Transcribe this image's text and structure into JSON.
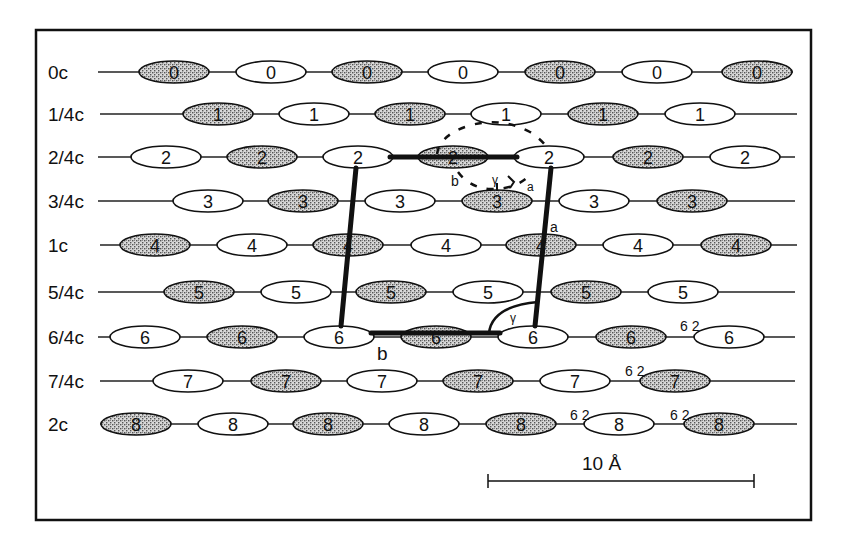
{
  "figure": {
    "frame": {
      "x": 36,
      "y": 30,
      "width": 775,
      "height": 490
    },
    "row_labels": [
      "0c",
      "1/4c",
      "2/4c",
      "3/4c",
      "1c",
      "5/4c",
      "6/4c",
      "7/4c",
      "2c"
    ],
    "rows": [
      {
        "label": "0c",
        "y": 72,
        "line": [
          98,
          793
        ],
        "molecules": [
          {
            "x": 174,
            "type": "shaded",
            "n": "0"
          },
          {
            "x": 271,
            "type": "open",
            "n": "0"
          },
          {
            "x": 367,
            "type": "shaded",
            "n": "0"
          },
          {
            "x": 463,
            "type": "open",
            "n": "0"
          },
          {
            "x": 560,
            "type": "shaded",
            "n": "0"
          },
          {
            "x": 657,
            "type": "open",
            "n": "0"
          },
          {
            "x": 757,
            "type": "shaded",
            "n": "0"
          }
        ]
      },
      {
        "label": "1/4c",
        "y": 114,
        "line": [
          100,
          797
        ],
        "molecules": [
          {
            "x": 218,
            "type": "shaded",
            "n": "1"
          },
          {
            "x": 314,
            "type": "open",
            "n": "1"
          },
          {
            "x": 410,
            "type": "shaded",
            "n": "1"
          },
          {
            "x": 506,
            "type": "open",
            "n": "1"
          },
          {
            "x": 603,
            "type": "shaded",
            "n": "1"
          },
          {
            "x": 700,
            "type": "open",
            "n": "1"
          }
        ]
      },
      {
        "label": "2/4c",
        "y": 157,
        "line": [
          98,
          795
        ],
        "molecules": [
          {
            "x": 166,
            "type": "open",
            "n": "2"
          },
          {
            "x": 262,
            "type": "shaded",
            "n": "2"
          },
          {
            "x": 358,
            "type": "open",
            "n": "2"
          },
          {
            "x": 453,
            "type": "shaded",
            "n": "2"
          },
          {
            "x": 549,
            "type": "open",
            "n": "2"
          },
          {
            "x": 648,
            "type": "shaded",
            "n": "2"
          },
          {
            "x": 745,
            "type": "open",
            "n": "2"
          }
        ]
      },
      {
        "label": "3/4c",
        "y": 201,
        "line": [
          98,
          795
        ],
        "molecules": [
          {
            "x": 208,
            "type": "open",
            "n": "3"
          },
          {
            "x": 303,
            "type": "shaded",
            "n": "3"
          },
          {
            "x": 400,
            "type": "open",
            "n": "3"
          },
          {
            "x": 497,
            "type": "shaded",
            "n": "3"
          },
          {
            "x": 594,
            "type": "open",
            "n": "3"
          },
          {
            "x": 692,
            "type": "shaded",
            "n": "3"
          }
        ]
      },
      {
        "label": "1c",
        "y": 245,
        "line": [
          100,
          797
        ],
        "molecules": [
          {
            "x": 155,
            "type": "shaded",
            "n": "4"
          },
          {
            "x": 252,
            "type": "open",
            "n": "4"
          },
          {
            "x": 348,
            "type": "shaded",
            "n": "4"
          },
          {
            "x": 446,
            "type": "open",
            "n": "4"
          },
          {
            "x": 541,
            "type": "shaded",
            "n": "4"
          },
          {
            "x": 638,
            "type": "open",
            "n": "4"
          },
          {
            "x": 736,
            "type": "shaded",
            "n": "4"
          }
        ]
      },
      {
        "label": "5/4c",
        "y": 292,
        "line": [
          98,
          795
        ],
        "molecules": [
          {
            "x": 199,
            "type": "shaded",
            "n": "5"
          },
          {
            "x": 296,
            "type": "open",
            "n": "5"
          },
          {
            "x": 391,
            "type": "shaded",
            "n": "5"
          },
          {
            "x": 488,
            "type": "open",
            "n": "5"
          },
          {
            "x": 586,
            "type": "shaded",
            "n": "5"
          },
          {
            "x": 683,
            "type": "open",
            "n": "5"
          }
        ]
      },
      {
        "label": "6/4c",
        "y": 337,
        "line": [
          98,
          795
        ],
        "molecules": [
          {
            "x": 145,
            "type": "open",
            "n": "6"
          },
          {
            "x": 242,
            "type": "shaded",
            "n": "6"
          },
          {
            "x": 339,
            "type": "open",
            "n": "6"
          },
          {
            "x": 436,
            "type": "shaded",
            "n": "6"
          },
          {
            "x": 533,
            "type": "open",
            "n": "6"
          },
          {
            "x": 631,
            "type": "shaded",
            "n": "6"
          },
          {
            "x": 729,
            "type": "open",
            "n": "6"
          }
        ]
      },
      {
        "label": "7/4c",
        "y": 381,
        "line": [
          100,
          795
        ],
        "molecules": [
          {
            "x": 188,
            "type": "open",
            "n": "7"
          },
          {
            "x": 286,
            "type": "shaded",
            "n": "7"
          },
          {
            "x": 382,
            "type": "open",
            "n": "7"
          },
          {
            "x": 478,
            "type": "shaded",
            "n": "7"
          },
          {
            "x": 575,
            "type": "open",
            "n": "7"
          },
          {
            "x": 675,
            "type": "shaded",
            "n": "7"
          }
        ]
      },
      {
        "label": "2c",
        "y": 424,
        "line": [
          100,
          797
        ],
        "molecules": [
          {
            "x": 136,
            "type": "shaded",
            "n": "8"
          },
          {
            "x": 233,
            "type": "open",
            "n": "8"
          },
          {
            "x": 328,
            "type": "shaded",
            "n": "8"
          },
          {
            "x": 424,
            "type": "open",
            "n": "8"
          },
          {
            "x": 521,
            "type": "shaded",
            "n": "8"
          },
          {
            "x": 619,
            "type": "open",
            "n": "8"
          },
          {
            "x": 719,
            "type": "shaded",
            "n": "8"
          }
        ]
      }
    ],
    "annotations": {
      "axis_a_label": "a",
      "axis_b_label": "b",
      "angle_label": "γ",
      "inset_a_label": "a",
      "inset_b_label": "b",
      "inset_gamma_label": "γ",
      "distance_marks": [
        {
          "text": "6 2",
          "x": 680,
          "y": 331
        },
        {
          "text": "6 2",
          "x": 625,
          "y": 376
        },
        {
          "text": "6 2",
          "x": 570,
          "y": 420
        },
        {
          "text": "6 2",
          "x": 670,
          "y": 420
        }
      ]
    },
    "scale_bar": {
      "label": "10 Å",
      "x1": 488,
      "x2": 754,
      "y": 481
    }
  }
}
